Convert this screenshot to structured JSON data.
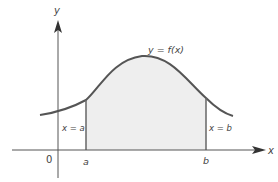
{
  "figure": {
    "y_axis_label": "y",
    "x_axis_label": "x",
    "origin_label": "0",
    "curve_label": "y = f(x)",
    "left_bound_tick": "a",
    "right_bound_tick": "b",
    "left_bound_label": "x = a",
    "right_bound_label": "x = b"
  },
  "colors": {
    "axis": "#555555",
    "curve": "#555555",
    "fill": "#eeeeee",
    "bound_line": "#666666"
  }
}
